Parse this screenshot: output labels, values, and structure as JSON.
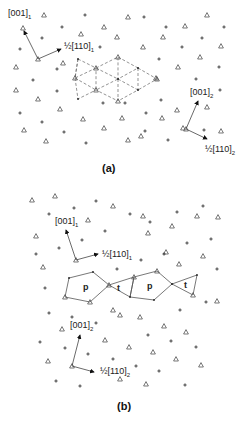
{
  "panels": [
    {
      "caption": "(a)",
      "vectors": [
        {
          "label": "[001]",
          "subscript": "1"
        },
        {
          "label": "½[110]",
          "subscript": "1"
        },
        {
          "label": "[001]",
          "subscript": "2"
        },
        {
          "label": "½[110]",
          "subscript": "2"
        }
      ],
      "markers": {
        "triangle": "atom-type-triangle",
        "plus": "atom-type-plus"
      },
      "overlay": "dashed-triangular-net"
    },
    {
      "caption": "(b)",
      "vectors": [
        {
          "label": "[001]",
          "subscript": "1"
        },
        {
          "label": "½[110]",
          "subscript": "1"
        },
        {
          "label": "[001]",
          "subscript": "2"
        },
        {
          "label": "½[110]",
          "subscript": "2"
        }
      ],
      "polygon_labels": [
        "p",
        "t",
        "p",
        "t"
      ],
      "overlay": "solid-polygon-chain"
    }
  ]
}
